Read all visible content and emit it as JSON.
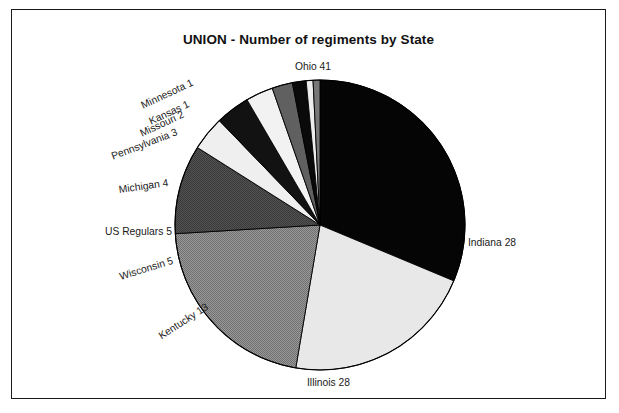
{
  "chart_data": {
    "type": "pie",
    "title": "UNION - Number of regiments by State",
    "subtitle": "",
    "xlabel": "",
    "ylabel": "",
    "legend_position": "none",
    "grid": false,
    "total": 131,
    "start_angle_deg": -90,
    "direction": "clockwise",
    "categories": [
      "Ohio",
      "Indiana",
      "Illinois",
      "Kentucky",
      "Wisconsin",
      "US Regulars",
      "Michigan",
      "Pennsylvania",
      "Missouri",
      "Kansas",
      "Minnesota"
    ],
    "values": [
      41,
      28,
      28,
      13,
      5,
      5,
      4,
      3,
      2,
      1,
      1
    ],
    "slices": [
      {
        "label": "Ohio 41",
        "name": "Ohio",
        "value": 41,
        "color": "#050505",
        "pattern": "solid-black"
      },
      {
        "label": "Indiana 28",
        "name": "Indiana",
        "value": 28,
        "color": "#e8e8e8",
        "pattern": "light-gray"
      },
      {
        "label": "Illinois 28",
        "name": "Illinois",
        "value": 28,
        "color": "#8d8d8d",
        "pattern": "mid-gray-dither"
      },
      {
        "label": "Kentucky 13",
        "name": "Kentucky",
        "value": 13,
        "color": "#4a4a4a",
        "pattern": "dark-gray-dither"
      },
      {
        "label": "Wisconsin 5",
        "name": "Wisconsin",
        "value": 5,
        "color": "#efefef",
        "pattern": "near-white"
      },
      {
        "label": "US Regulars 5",
        "name": "US Regulars",
        "value": 5,
        "color": "#121212",
        "pattern": "near-black"
      },
      {
        "label": "Michigan 4",
        "name": "Michigan",
        "value": 4,
        "color": "#f2f2f2",
        "pattern": "near-white"
      },
      {
        "label": "Pennsylvania 3",
        "name": "Pennsylvania",
        "value": 3,
        "color": "#606060",
        "pattern": "dark-gray"
      },
      {
        "label": "Missouri 2",
        "name": "Missouri",
        "value": 2,
        "color": "#0a0a0a",
        "pattern": "solid-black"
      },
      {
        "label": "Kansas 1",
        "name": "Kansas",
        "value": 1,
        "color": "#ededed",
        "pattern": "near-white"
      },
      {
        "label": "Minnesota 1",
        "name": "Minnesota",
        "value": 1,
        "color": "#777777",
        "pattern": "mid-gray"
      }
    ]
  },
  "frame": {
    "border_color": "#1a1a1a",
    "background": "#ffffff"
  },
  "labels": {
    "ohio": "Ohio 41",
    "indiana": "Indiana 28",
    "illinois": "Illinois 28",
    "kentucky": "Kentucky 13",
    "wisconsin": "Wisconsin 5",
    "us_regulars": "US Regulars 5",
    "michigan": "Michigan 4",
    "pennsylvania": "Pennsylvania 3",
    "missouri": "Missouri 2",
    "kansas": "Kansas 1",
    "minnesota": "Minnesota 1"
  }
}
